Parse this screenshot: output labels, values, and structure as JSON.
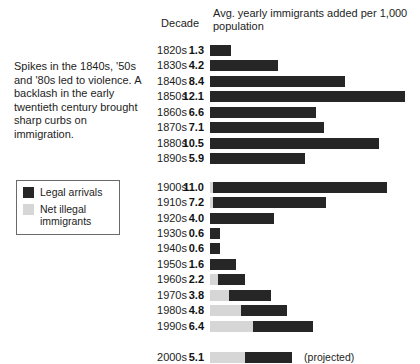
{
  "caption": "Spikes in the 1840s, '50s and '80s led to violence. A backlash in the early twentieth century brought sharp curbs on immigration.",
  "legend": {
    "items": [
      {
        "key": "legal",
        "label": "Legal arrivals",
        "color": "#262626"
      },
      {
        "key": "illegal",
        "label": "Net illegal immigrants",
        "color": "#d6d6d6"
      }
    ]
  },
  "headers": {
    "decade": "Decade",
    "value": "Avg. yearly immigrants added per 1,000 population"
  },
  "chart_data": {
    "type": "bar",
    "orientation": "horizontal",
    "stacked": true,
    "title": "Avg. yearly immigrants added per 1,000 population",
    "xlabel": "",
    "ylabel": "Decade",
    "xlim": [
      0,
      13
    ],
    "grid": false,
    "legend_position": "left",
    "unit": "immigrants per 1,000 population",
    "categories": [
      "1820s",
      "1830s",
      "1840s",
      "1850s",
      "1860s",
      "1870s",
      "1880s",
      "1890s",
      "1900s",
      "1910s",
      "1920s",
      "1930s",
      "1940s",
      "1950s",
      "1960s",
      "1970s",
      "1980s",
      "1990s",
      "2000s"
    ],
    "values": [
      1.3,
      4.2,
      8.4,
      12.1,
      6.6,
      7.1,
      10.5,
      5.9,
      11.0,
      7.2,
      4.0,
      0.6,
      0.6,
      1.6,
      2.2,
      3.8,
      4.8,
      6.4,
      5.1
    ],
    "series": [
      {
        "name": "Net illegal immigrants",
        "color": "#d6d6d6",
        "values": [
          0,
          0,
          0,
          0,
          0,
          0,
          0,
          0,
          0.2,
          0.2,
          0,
          0,
          0,
          0,
          0.5,
          1.2,
          1.9,
          2.7,
          2.2
        ]
      },
      {
        "name": "Legal arrivals",
        "color": "#262626",
        "values": [
          1.3,
          4.2,
          8.4,
          12.1,
          6.6,
          7.1,
          10.5,
          5.9,
          10.8,
          7.0,
          4.0,
          0.6,
          0.6,
          1.6,
          1.7,
          2.6,
          2.9,
          3.7,
          2.9
        ]
      }
    ],
    "annotations": [
      {
        "category": "2000s",
        "text": "(projected)"
      }
    ],
    "rows": [
      {
        "decade": "1820s",
        "value": "1.3",
        "illegal": 0,
        "legal": 1.3,
        "note": ""
      },
      {
        "decade": "1830s",
        "value": "4.2",
        "illegal": 0,
        "legal": 4.2,
        "note": ""
      },
      {
        "decade": "1840s",
        "value": "8.4",
        "illegal": 0,
        "legal": 8.4,
        "note": ""
      },
      {
        "decade": "1850s",
        "value": "12.1",
        "illegal": 0,
        "legal": 12.1,
        "note": ""
      },
      {
        "decade": "1860s",
        "value": "6.6",
        "illegal": 0,
        "legal": 6.6,
        "note": ""
      },
      {
        "decade": "1870s",
        "value": "7.1",
        "illegal": 0,
        "legal": 7.1,
        "note": ""
      },
      {
        "decade": "1880s",
        "value": "10.5",
        "illegal": 0,
        "legal": 10.5,
        "note": ""
      },
      {
        "decade": "1890s",
        "value": "5.9",
        "illegal": 0,
        "legal": 5.9,
        "note": ""
      },
      {
        "decade": "1900s",
        "value": "11.0",
        "illegal": 0.2,
        "legal": 10.8,
        "note": ""
      },
      {
        "decade": "1910s",
        "value": "7.2",
        "illegal": 0.2,
        "legal": 7.0,
        "note": ""
      },
      {
        "decade": "1920s",
        "value": "4.0",
        "illegal": 0,
        "legal": 4.0,
        "note": ""
      },
      {
        "decade": "1930s",
        "value": "0.6",
        "illegal": 0,
        "legal": 0.6,
        "note": ""
      },
      {
        "decade": "1940s",
        "value": "0.6",
        "illegal": 0,
        "legal": 0.6,
        "note": ""
      },
      {
        "decade": "1950s",
        "value": "1.6",
        "illegal": 0,
        "legal": 1.6,
        "note": ""
      },
      {
        "decade": "1960s",
        "value": "2.2",
        "illegal": 0.5,
        "legal": 1.7,
        "note": ""
      },
      {
        "decade": "1970s",
        "value": "3.8",
        "illegal": 1.2,
        "legal": 2.6,
        "note": ""
      },
      {
        "decade": "1980s",
        "value": "4.8",
        "illegal": 1.9,
        "legal": 2.9,
        "note": ""
      },
      {
        "decade": "1990s",
        "value": "6.4",
        "illegal": 2.7,
        "legal": 3.7,
        "note": ""
      },
      {
        "decade": "2000s",
        "value": "5.1",
        "illegal": 2.2,
        "legal": 2.9,
        "note": "(projected)"
      }
    ]
  }
}
